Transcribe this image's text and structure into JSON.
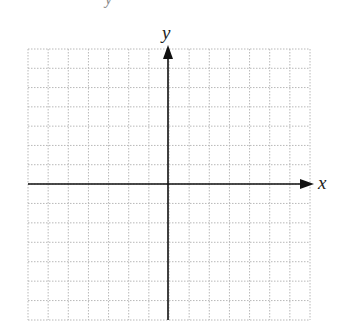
{
  "diagram": {
    "type": "coordinate-grid",
    "x_axis_label": "x",
    "y_axis_label": "y",
    "top_cut_label": "y",
    "grid": {
      "columns": 14,
      "rows": 14,
      "origin_col": 7,
      "origin_row": 7,
      "left": 28,
      "top": 49,
      "right": 310,
      "bottom": 320,
      "origin_x": 168,
      "origin_y": 184
    },
    "colors": {
      "grid": "#b8b8b8",
      "axis": "#111111",
      "background": "#ffffff"
    }
  }
}
